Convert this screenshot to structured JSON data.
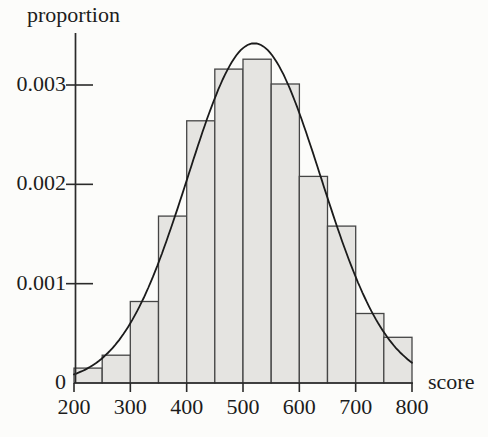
{
  "chart_data": {
    "type": "bar",
    "subtype": "histogram-with-normal-curve",
    "title": "",
    "xlabel": "score",
    "ylabel": "proportion",
    "bin_start": 200,
    "bin_width": 50,
    "categories": [
      "200-250",
      "250-300",
      "300-350",
      "350-400",
      "400-450",
      "450-500",
      "500-550",
      "550-600",
      "600-650",
      "650-700",
      "700-750",
      "750-800"
    ],
    "values": [
      0.00015,
      0.00028,
      0.00082,
      0.00168,
      0.00264,
      0.00316,
      0.00326,
      0.00301,
      0.00208,
      0.00158,
      0.0007,
      0.00046
    ],
    "xlim": [
      200,
      800
    ],
    "ylim": [
      0,
      0.0035
    ],
    "xticks": [
      200,
      300,
      400,
      500,
      600,
      700,
      800
    ],
    "xtick_labels": [
      "200",
      "300",
      "400",
      "500",
      "600",
      "700",
      "800"
    ],
    "yticks": [
      0,
      0.001,
      0.002,
      0.003
    ],
    "ytick_labels": [
      "0",
      "0.001",
      "0.002",
      "0.003"
    ],
    "grid": "off",
    "legend": "none",
    "overlay_curve": {
      "shape": "normal",
      "mean": 520,
      "sd": 118,
      "peak": 0.00342
    },
    "colors": {
      "background": "#fcfcfa",
      "bar_fill": "#e5e4e1",
      "bar_stroke": "#454545",
      "axis": "#2a2a2a",
      "curve": "#1b1b1b",
      "text": "#1c1c1c"
    }
  }
}
